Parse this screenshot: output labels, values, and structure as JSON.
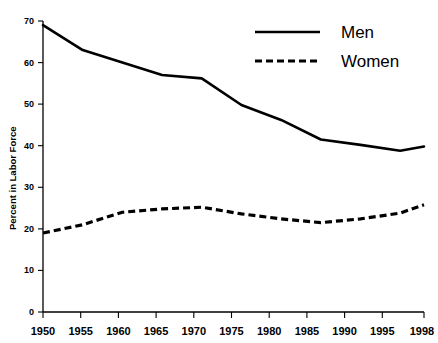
{
  "chart_data": {
    "type": "line",
    "title": "",
    "subtitle": "",
    "xlabel": "",
    "ylabel": "Percent in Labor Force",
    "x": [
      1950,
      1955,
      1960,
      1965,
      1970,
      1975,
      1980,
      1985,
      1990,
      1995,
      1998
    ],
    "xticklabels": [
      "1950",
      "1955",
      "1960",
      "1965",
      "1970",
      "1975",
      "1980",
      "1985",
      "1990",
      "1995",
      "1998"
    ],
    "yticklabels": [
      "0",
      "10",
      "20",
      "30",
      "40",
      "50",
      "60",
      "70"
    ],
    "yticks": [
      0,
      10,
      20,
      30,
      40,
      50,
      60,
      70
    ],
    "xlim": [
      1950,
      1998
    ],
    "ylim": [
      0,
      70
    ],
    "grid": false,
    "legend_position": "top-right",
    "series": [
      {
        "name": "Men",
        "style": "solid",
        "color": "#000000",
        "values": [
          69.0,
          63.0,
          60.0,
          57.0,
          56.2,
          49.8,
          46.2,
          41.5,
          40.2,
          38.8,
          39.8
        ]
      },
      {
        "name": "Women",
        "style": "dashed",
        "color": "#000000",
        "values": [
          19.0,
          21.0,
          24.0,
          24.8,
          25.2,
          23.6,
          22.4,
          21.5,
          22.4,
          23.8,
          25.8
        ]
      }
    ]
  },
  "legend": {
    "items": [
      {
        "label": "Men",
        "style": "solid"
      },
      {
        "label": "Women",
        "style": "dashed"
      }
    ]
  },
  "axes": {
    "y_title": "Percent in Labor Force"
  }
}
